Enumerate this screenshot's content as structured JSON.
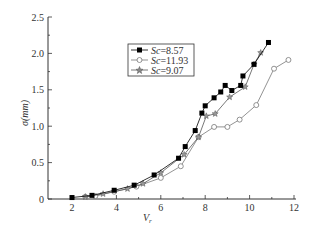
{
  "chart_data": {
    "type": "line",
    "title": "",
    "xlabel": "V_r",
    "ylabel": "σ(mm)",
    "xlim": [
      1,
      12
    ],
    "ylim": [
      0,
      2.5
    ],
    "xticks": [
      2,
      4,
      6,
      8,
      10,
      12
    ],
    "xtick_labels": [
      "2",
      "4",
      "6",
      "8",
      "10",
      "12"
    ],
    "yticks": [
      0,
      0.5,
      1.0,
      1.5,
      2.0,
      2.5
    ],
    "ytick_labels": [
      "0",
      "0.5",
      "1.0",
      "1.5",
      "2.0",
      "2.5"
    ],
    "grid": false,
    "legend_position": "upper-left-center",
    "series": [
      {
        "name": "Sc=8.57",
        "marker": "filled-square",
        "color": "#000000",
        "x": [
          2.0,
          2.9,
          3.9,
          4.8,
          5.7,
          6.8,
          7.1,
          7.55,
          7.85,
          8.0,
          8.4,
          8.7,
          8.9,
          9.2,
          9.6,
          9.7,
          10.2,
          10.85
        ],
        "y": [
          0.02,
          0.05,
          0.12,
          0.19,
          0.33,
          0.56,
          0.72,
          0.94,
          1.18,
          1.28,
          1.39,
          1.47,
          1.56,
          1.49,
          1.56,
          1.69,
          1.85,
          2.15
        ]
      },
      {
        "name": "Sc=11.93",
        "marker": "open-circle",
        "color": "#777777",
        "x": [
          2.6,
          3.05,
          3.9,
          4.9,
          6.0,
          6.9,
          7.7,
          8.4,
          9.0,
          9.55,
          10.3,
          11.1,
          11.75
        ],
        "y": [
          0.03,
          0.04,
          0.1,
          0.17,
          0.29,
          0.45,
          0.85,
          0.99,
          0.99,
          1.09,
          1.29,
          1.79,
          1.91
        ]
      },
      {
        "name": "Sc=9.07",
        "marker": "star",
        "color": "#555555",
        "x": [
          2.6,
          3.4,
          4.5,
          5.2,
          6.0,
          7.05,
          7.7,
          8.05,
          8.45,
          9.1,
          9.8,
          10.2,
          10.5
        ],
        "y": [
          0.03,
          0.07,
          0.14,
          0.21,
          0.36,
          0.61,
          0.85,
          1.14,
          1.17,
          1.4,
          1.54,
          1.85,
          2.01
        ]
      }
    ]
  },
  "legend": {
    "items": [
      {
        "label_prefix": "Sc",
        "label_value": "=8.57"
      },
      {
        "label_prefix": "Sc",
        "label_value": "=11.93"
      },
      {
        "label_prefix": "Sc",
        "label_value": "=9.07"
      }
    ]
  },
  "axes": {
    "xlabel_main": "V",
    "xlabel_sub": "r",
    "ylabel": "σ(mm)"
  }
}
